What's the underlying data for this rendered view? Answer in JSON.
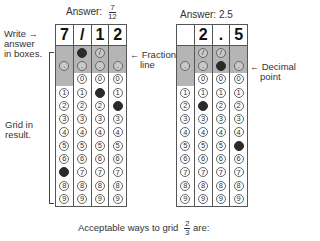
{
  "left_example": {
    "answer_label": "Answer:",
    "answer_numerator": "7",
    "answer_denominator": "12",
    "top_row": [
      "7",
      "/",
      "1",
      "2"
    ],
    "slash_row": [
      "",
      "filled",
      "empty",
      ""
    ],
    "decimal_row": [
      "empty",
      "empty",
      "empty",
      "empty"
    ],
    "digits": [
      "0",
      "1",
      "2",
      "3",
      "4",
      "5",
      "6",
      "7",
      "8",
      "9"
    ],
    "filled": {
      "col0": "7",
      "col1": "/",
      "col2": "1",
      "col3": "2"
    }
  },
  "right_example": {
    "answer_label": "Answer: 2.5",
    "top_row": [
      "",
      "2",
      ".",
      "5"
    ],
    "slash_row": [
      "",
      "empty",
      "empty",
      ""
    ],
    "decimal_row": [
      "empty",
      "empty",
      "filled",
      "empty"
    ],
    "digits": [
      "0",
      "1",
      "2",
      "3",
      "4",
      "5",
      "6",
      "7",
      "8",
      "9"
    ],
    "filled": {
      "col1": "2",
      "col2": ".",
      "col3": "5"
    }
  },
  "annotations": {
    "write_answer": [
      "Write",
      "answer",
      "in boxes."
    ],
    "fraction_line": [
      "Fraction",
      "line"
    ],
    "decimal_point": [
      "Decimal",
      "point"
    ],
    "grid_in_result": [
      "Grid in",
      "result."
    ],
    "arrow_left": "←",
    "arrow_right": "→"
  },
  "caption": {
    "text": "Acceptable ways to grid",
    "frac_numerator": "2",
    "frac_denominator": "3",
    "suffix": "are:"
  },
  "symbols": {
    "slash": "/",
    "dot": "."
  },
  "colors": {
    "shaded_row": "#b5b5b5",
    "filled_bubble": "#2a2a2a",
    "border": "#555555"
  }
}
